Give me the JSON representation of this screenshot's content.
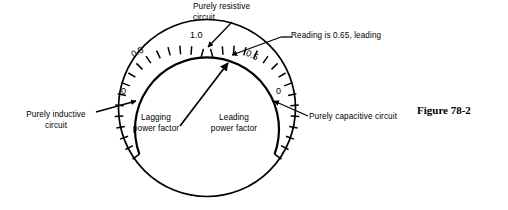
{
  "figure": {
    "caption": "Figure 78-2",
    "caption_x": 417,
    "caption_y": 105
  },
  "meter": {
    "type": "power-factor-meter-dial",
    "center_x": 207,
    "center_y": 108,
    "outer_radius": 89,
    "scale_radius": 72,
    "scale_start_deg": 200,
    "scale_end_deg": 340
  },
  "scale": {
    "numbers": [
      {
        "label": "0",
        "x": 124,
        "y": 92,
        "side": "left"
      },
      {
        "label": "0.5",
        "x": 134,
        "y": 52,
        "side": "left"
      },
      {
        "label": "1.0",
        "x": 194,
        "y": 34,
        "side": "top"
      },
      {
        "label": "0.5",
        "x": 248,
        "y": 55,
        "side": "right"
      },
      {
        "label": "0",
        "x": 276,
        "y": 92,
        "side": "right"
      }
    ]
  },
  "annotations": {
    "purely_resistive": {
      "line1": "Purely resistive",
      "line2": "circuit",
      "x": 193,
      "y": 3
    },
    "reading": {
      "text": "Reading is 0.65, leading",
      "x": 283,
      "y": 36
    },
    "purely_inductive": {
      "line1": "Purely inductive",
      "line2": "circuit",
      "x": 18,
      "y": 113
    },
    "purely_capacitive": {
      "text": "Purely capacitive circuit",
      "x": 300,
      "y": 114
    },
    "lagging": {
      "line1": "Lagging",
      "line2": "power factor",
      "x": 132,
      "y": 116
    },
    "leading": {
      "line1": "Leading",
      "line2": "power factor",
      "x": 208,
      "y": 116
    }
  },
  "colors": {
    "ink": "#000000",
    "background": "#ffffff"
  }
}
